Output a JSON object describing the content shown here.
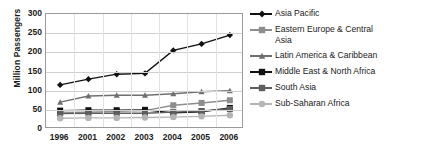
{
  "chart_data": {
    "type": "line",
    "title": "",
    "xlabel": "",
    "ylabel": "Million Passengers",
    "categories": [
      "1996",
      "2001",
      "2002",
      "2003",
      "2004",
      "2005",
      "2006"
    ],
    "ylim": [
      0,
      300
    ],
    "yticks": [
      0,
      50,
      100,
      150,
      200,
      250,
      300
    ],
    "grid": true,
    "legend_position": "right",
    "series": [
      {
        "name": "Asia Pacific",
        "marker": "diamond",
        "color": "#111111",
        "values": [
          115,
          130,
          143,
          145,
          205,
          222,
          245
        ]
      },
      {
        "name": "Eastern Europe & Central Asia",
        "marker": "square",
        "color": "#8d8d8d",
        "values": [
          42,
          44,
          46,
          48,
          62,
          68,
          75
        ]
      },
      {
        "name": "Latin America & Caribbean",
        "marker": "triangle",
        "color": "#6f6f6f",
        "values": [
          70,
          86,
          88,
          88,
          92,
          97,
          100
        ]
      },
      {
        "name": "Middle East & North Africa",
        "marker": "square",
        "color": "#111111",
        "values": [
          48,
          49,
          49,
          50,
          42,
          45,
          55
        ]
      },
      {
        "name": "South Asia",
        "marker": "square",
        "color": "#5e5e5e",
        "values": [
          40,
          41,
          41,
          41,
          44,
          47,
          52
        ]
      },
      {
        "name": "Sub-Saharan Africa",
        "marker": "circle",
        "color": "#b4b4b4",
        "values": [
          28,
          29,
          29,
          30,
          31,
          33,
          36
        ]
      }
    ]
  },
  "legend": {
    "items": [
      {
        "label": "Asia Pacific"
      },
      {
        "label": "Eastern Europe & Central\nAsia"
      },
      {
        "label": "Latin America & Caribbean"
      },
      {
        "label": "Middle East & North Africa"
      },
      {
        "label": "South Asia"
      },
      {
        "label": "Sub-Saharan Africa"
      }
    ]
  }
}
